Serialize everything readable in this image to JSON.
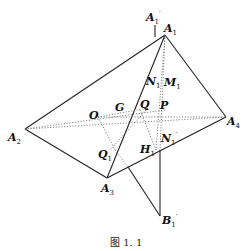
{
  "figure": {
    "caption": "图 1. 1",
    "points": {
      "A1": {
        "name": "A",
        "sub": "1",
        "prime": ""
      },
      "A1p": {
        "name": "A",
        "sub": "1",
        "prime": "′"
      },
      "A2": {
        "name": "A",
        "sub": "2",
        "prime": ""
      },
      "A3": {
        "name": "A",
        "sub": "3",
        "prime": ""
      },
      "A4": {
        "name": "A",
        "sub": "4",
        "prime": ""
      },
      "B1p": {
        "name": "B",
        "sub": "1",
        "prime": "′"
      },
      "O": {
        "name": "O",
        "sub": "",
        "prime": ""
      },
      "G": {
        "name": "G",
        "sub": "",
        "prime": ""
      },
      "Q": {
        "name": "Q",
        "sub": "",
        "prime": ""
      },
      "P": {
        "name": "P",
        "sub": "",
        "prime": ""
      },
      "N1": {
        "name": "N",
        "sub": "1",
        "prime": ""
      },
      "M1": {
        "name": "M",
        "sub": "1",
        "prime": ""
      },
      "H1": {
        "name": "H",
        "sub": "1",
        "prime": ""
      },
      "N1p": {
        "name": "N",
        "sub": "1",
        "prime": "′"
      },
      "Q1": {
        "name": "Q",
        "sub": "1",
        "prime": ""
      }
    }
  }
}
